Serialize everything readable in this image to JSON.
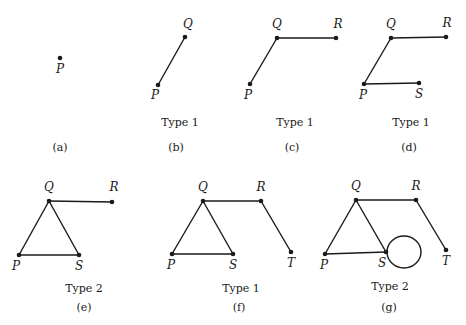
{
  "panels": [
    {
      "id": "a",
      "caption": "(a)",
      "type_label": "",
      "vertices": [
        "P"
      ],
      "edges": [],
      "loops": []
    },
    {
      "id": "b",
      "caption": "(b)",
      "type_label": "Type 1",
      "vertices": [
        "P",
        "Q"
      ],
      "edges": [
        [
          "P",
          "Q"
        ]
      ],
      "loops": []
    },
    {
      "id": "c",
      "caption": "(c)",
      "type_label": "Type 1",
      "vertices": [
        "P",
        "Q",
        "R"
      ],
      "edges": [
        [
          "P",
          "Q"
        ],
        [
          "Q",
          "R"
        ]
      ],
      "loops": []
    },
    {
      "id": "d",
      "caption": "(d)",
      "type_label": "Type 1",
      "vertices": [
        "P",
        "Q",
        "R",
        "S"
      ],
      "edges": [
        [
          "P",
          "Q"
        ],
        [
          "Q",
          "R"
        ],
        [
          "P",
          "S"
        ]
      ],
      "loops": []
    },
    {
      "id": "e",
      "caption": "(e)",
      "type_label": "Type 2",
      "vertices": [
        "P",
        "Q",
        "R",
        "S"
      ],
      "edges": [
        [
          "P",
          "Q"
        ],
        [
          "Q",
          "R"
        ],
        [
          "P",
          "S"
        ],
        [
          "Q",
          "S"
        ]
      ],
      "loops": []
    },
    {
      "id": "f",
      "caption": "(f)",
      "type_label": "Type 1",
      "vertices": [
        "P",
        "Q",
        "R",
        "S",
        "T"
      ],
      "edges": [
        [
          "P",
          "Q"
        ],
        [
          "Q",
          "R"
        ],
        [
          "P",
          "S"
        ],
        [
          "Q",
          "S"
        ],
        [
          "R",
          "T"
        ]
      ],
      "loops": []
    },
    {
      "id": "g",
      "caption": "(g)",
      "type_label": "Type 2",
      "vertices": [
        "P",
        "Q",
        "R",
        "S",
        "T"
      ],
      "edges": [
        [
          "P",
          "Q"
        ],
        [
          "Q",
          "R"
        ],
        [
          "P",
          "S"
        ],
        [
          "Q",
          "S"
        ],
        [
          "R",
          "T"
        ]
      ],
      "loops": [
        "S"
      ]
    }
  ]
}
